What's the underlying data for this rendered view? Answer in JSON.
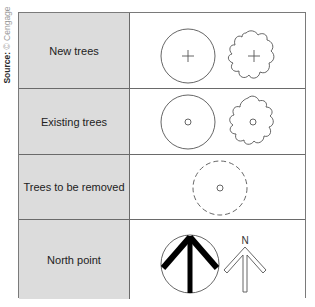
{
  "source": {
    "label": "Source:",
    "credit": "© Cengage"
  },
  "rows": [
    {
      "label": "New trees",
      "symbols": [
        "circle-with-cross",
        "irregular-crown-with-cross"
      ]
    },
    {
      "label": "Existing trees",
      "symbols": [
        "circle-with-dot",
        "irregular-crown-with-dot"
      ]
    },
    {
      "label": "Trees to be removed",
      "symbols": [
        "dashed-circle-with-dot"
      ]
    },
    {
      "label": "North point",
      "symbols": [
        "circle-north-arrow",
        "outline-north-arrow"
      ],
      "arrow_letter": "N"
    }
  ],
  "colors": {
    "label_bg": "#dcdcdc",
    "line": "#555555",
    "fill_dark": "#000000"
  }
}
